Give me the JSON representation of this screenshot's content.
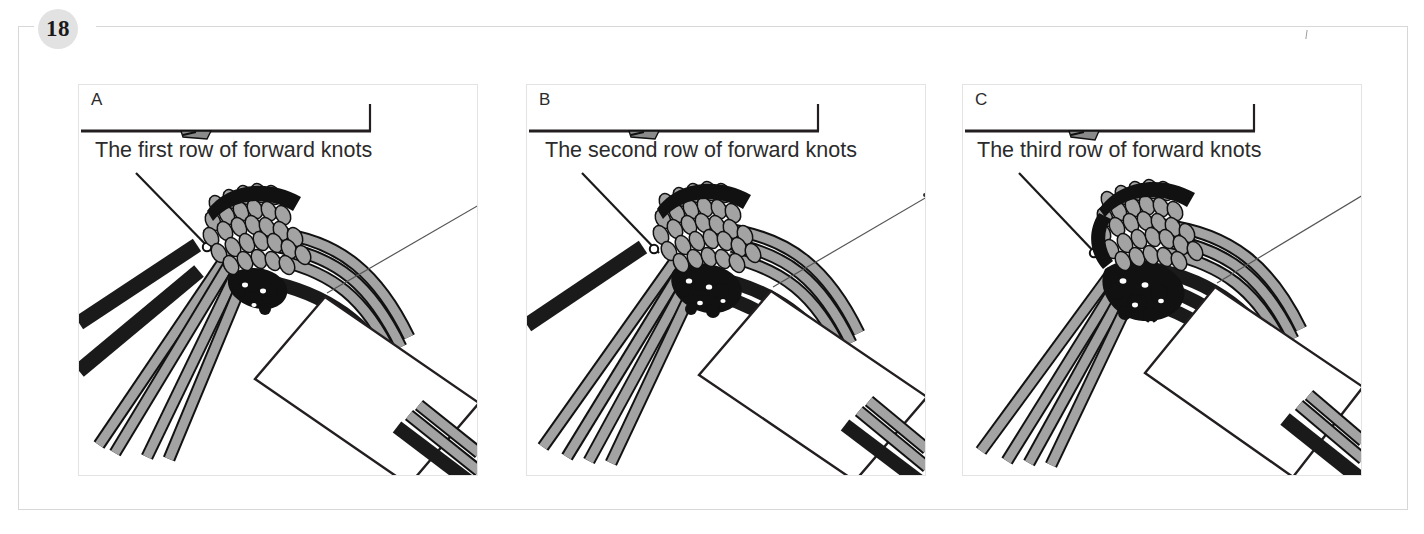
{
  "page": {
    "chapter_number": "18",
    "frame_color": "#d7d7d7",
    "badge_bg": "#e2e2e2"
  },
  "colors": {
    "cord_dark": "#1a1a1a",
    "cord_light": "#a3a3a3",
    "cord_outline": "#111111",
    "panel_border": "#e3e3e3",
    "text": "#2b2b2b",
    "rule": "#231f20"
  },
  "panels": [
    {
      "id": "panel-a",
      "letter": "A",
      "caption": "The first row of forward knots"
    },
    {
      "id": "panel-b",
      "letter": "B",
      "caption": "The second row of forward knots"
    },
    {
      "id": "panel-c",
      "letter": "C",
      "caption": "The third row of forward knots"
    }
  ],
  "diagram": {
    "card_label": "white rectangular card",
    "scale_rule_label": "horizontal rule with end tick and arrow pointer"
  }
}
